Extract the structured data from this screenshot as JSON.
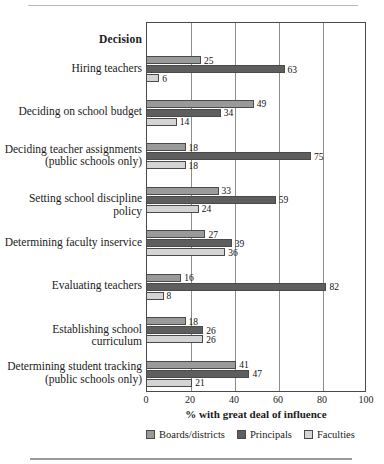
{
  "chart_data": {
    "type": "bar",
    "orientation": "horizontal",
    "title": "",
    "category_header": "Decision",
    "xlabel": "% with great deal of influence",
    "ylabel": "",
    "xlim": [
      0,
      100
    ],
    "xticks": [
      0,
      20,
      40,
      60,
      80,
      100
    ],
    "xticklabels": [
      "0",
      "20",
      "40",
      "60",
      "80",
      "100"
    ],
    "grid": "vertical",
    "legend_position": "bottom",
    "categories": [
      {
        "line1": "Hiring teachers",
        "line2": ""
      },
      {
        "line1": "Deciding on school budget",
        "line2": ""
      },
      {
        "line1": "Deciding teacher assignments",
        "line2": "(public schools only)"
      },
      {
        "line1": "Setting school discipline policy",
        "line2": ""
      },
      {
        "line1": "Determining faculty inservice",
        "line2": ""
      },
      {
        "line1": "Evaluating teachers",
        "line2": ""
      },
      {
        "line1": "Establishing school curriculum",
        "line2": ""
      },
      {
        "line1": "Determining student tracking",
        "line2": "(public schools only)"
      }
    ],
    "series": [
      {
        "name": "Boards/districts",
        "color": "#9a9a9a",
        "values": [
          25,
          49,
          18,
          33,
          27,
          16,
          18,
          41
        ]
      },
      {
        "name": "Principals",
        "color": "#5e5e5e",
        "values": [
          63,
          34,
          75,
          59,
          39,
          82,
          26,
          47
        ]
      },
      {
        "name": "Faculties",
        "color": "#d4d4d4",
        "values": [
          6,
          14,
          18,
          24,
          36,
          8,
          26,
          21
        ]
      }
    ]
  }
}
